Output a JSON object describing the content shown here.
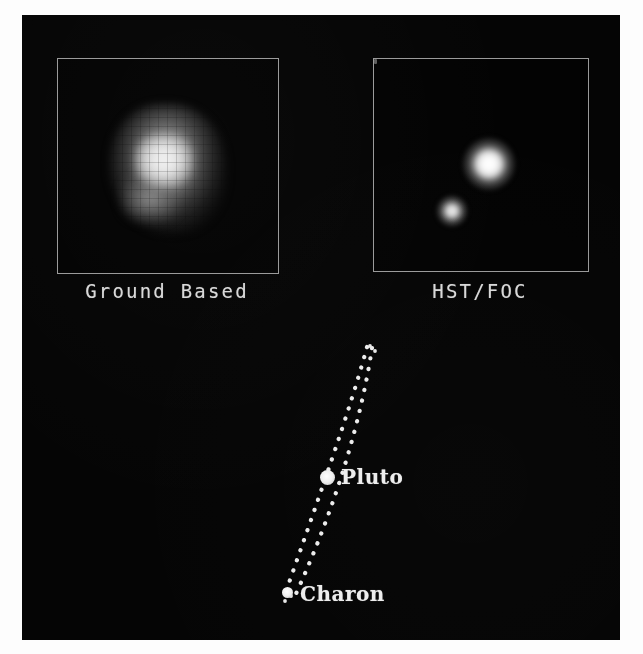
{
  "figure": {
    "background_color": "#050505",
    "frame_color": "#9a9a9a",
    "label_color": "#d9d9d9"
  },
  "panels": [
    {
      "id": "ground",
      "label": "Ground Based",
      "description": "Single unresolved, pixelated blob of the Pluto-Charon system",
      "objects": [
        {
          "name": "pluto-charon-blob",
          "resolved": false
        }
      ]
    },
    {
      "id": "hst",
      "label": "HST/FOC",
      "description": "Two clearly resolved point sources",
      "objects": [
        {
          "name": "pluto",
          "resolved": true,
          "relative_brightness": "bright",
          "position": "upper-right"
        },
        {
          "name": "charon",
          "resolved": true,
          "relative_brightness": "faint",
          "position": "lower-left"
        }
      ]
    }
  ],
  "orbit_diagram": {
    "orbit_style": "dotted-ellipse",
    "orbit_color": "#e8e8e8",
    "bodies": [
      {
        "name": "pluto",
        "label": "Pluto",
        "marker_size": "large"
      },
      {
        "name": "charon",
        "label": "Charon",
        "marker_size": "small"
      }
    ]
  }
}
